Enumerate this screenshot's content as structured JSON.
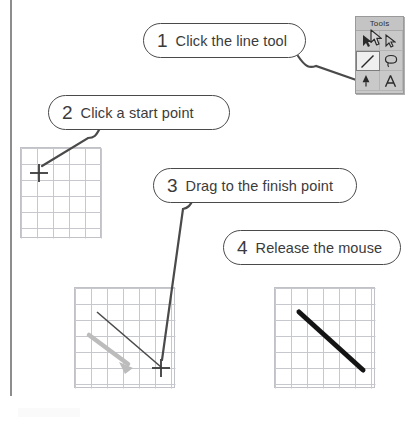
{
  "figure": {
    "kind": "instructional-diagram",
    "ink_color": "#3b3b3b",
    "line_color": "#4a4a4a",
    "grid_line_color": "#c0c2c8",
    "drag_arrow_color": "#b5b5b5",
    "drawn_line_color": "#1a1a1a"
  },
  "callouts": [
    {
      "number": "1",
      "text": "Click the line tool"
    },
    {
      "number": "2",
      "text": "Click a start point"
    },
    {
      "number": "3",
      "text": "Drag to the finish point"
    },
    {
      "number": "4",
      "text": "Release the mouse"
    }
  ],
  "tools_palette": {
    "title": "Tools",
    "tools": [
      {
        "name": "arrow-pointer-tool",
        "selected": false
      },
      {
        "name": "subselect-arrow-tool",
        "selected": false
      },
      {
        "name": "line-tool",
        "selected": true
      },
      {
        "name": "lasso-tool",
        "selected": false
      },
      {
        "name": "paint-bucket-tool",
        "selected": false
      },
      {
        "name": "text-tool",
        "selected": false,
        "glyph": "A"
      }
    ],
    "selected_tool": "line-tool"
  },
  "canvases": [
    {
      "name": "canvas-start-point",
      "step": "2",
      "columns": 5,
      "rows": 6,
      "cell_size": 16,
      "marker": "crosshair",
      "marker_cell": {
        "col": 1,
        "row": 1
      },
      "has_drawn_line": false
    },
    {
      "name": "canvas-drag",
      "step": "3",
      "columns": 6,
      "rows": 6,
      "cell_size": 16,
      "marker": "crosshair",
      "marker_cell": {
        "col": 5,
        "row": 5
      },
      "has_drawn_line": true,
      "drag_direction": "down-right",
      "drag_arrow": true
    },
    {
      "name": "canvas-finished-line",
      "step": "4",
      "columns": 6,
      "rows": 6,
      "cell_size": 16,
      "marker": "none",
      "has_drawn_line": true,
      "line_weight": "thick"
    }
  ]
}
